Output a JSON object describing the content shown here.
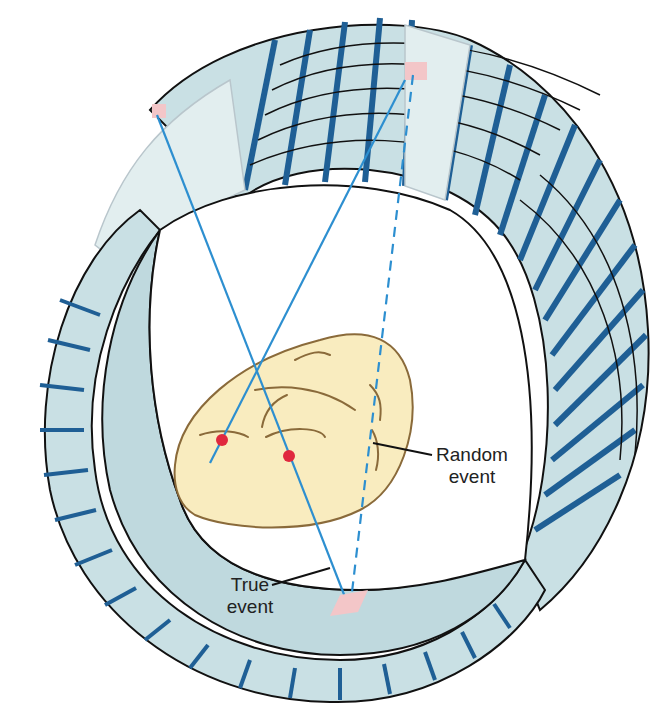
{
  "diagram": {
    "labels": {
      "random_event": [
        "Random",
        "event"
      ],
      "true_event": [
        "True",
        "event"
      ]
    },
    "colors": {
      "detector_face": "#c9e0e4",
      "detector_side": "#1f5f95",
      "detector_ghost": "#e2eeef",
      "ring_inner_face": "#bfd9de",
      "bore": "#ffffff",
      "patient_body": "#f9ecbf",
      "patient_outline": "#8a6a3a",
      "line_of_response": "#2d8fd0",
      "annihilation_point": "#e0283e",
      "hit_detector": "#f3c6c8",
      "outline": "#111111",
      "label_text": "#222222"
    },
    "events": [
      {
        "type": "true",
        "style": "solid",
        "from": [
          157,
          115
        ],
        "to": [
          345,
          597
        ]
      },
      {
        "type": "true",
        "style": "solid",
        "from": [
          210,
          463
        ],
        "to": [
          370,
          230
        ]
      },
      {
        "type": "random",
        "style": "dashed",
        "from": [
          413,
          75
        ],
        "to": [
          352,
          592
        ]
      }
    ],
    "annihilation_points": [
      [
        222,
        440
      ],
      [
        289,
        456
      ]
    ]
  }
}
